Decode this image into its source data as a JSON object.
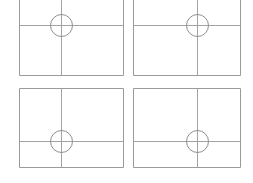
{
  "canvas": {
    "width": 253,
    "height": 183,
    "background_color": "#ffffff"
  },
  "style": {
    "frame_stroke_color": "#9a9a9a",
    "crosshair_stroke_color": "#a3a3a3",
    "circle_stroke_color": "#8f8f8f",
    "frame_stroke_width": 1,
    "crosshair_stroke_width": 1,
    "circle_stroke_width": 1
  },
  "layout": {
    "rows": 2,
    "columns": 2,
    "panel_count": 4
  },
  "panels": [
    {
      "id": "panel-top-left",
      "name": "Top Left Panel",
      "x": 19,
      "y": -7,
      "width": 104,
      "height": 82,
      "crosshair_x": 61,
      "crosshair_y": 25,
      "circle_cx": 61,
      "circle_cy": 25,
      "circle_r": 11
    },
    {
      "id": "panel-top-right",
      "name": "Top Right Panel",
      "x": 133,
      "y": -7,
      "width": 107,
      "height": 82,
      "crosshair_x": 197,
      "crosshair_y": 25,
      "circle_cx": 197,
      "circle_cy": 25,
      "circle_r": 11
    },
    {
      "id": "panel-bottom-left",
      "name": "Bottom Left Panel",
      "x": 19,
      "y": 88,
      "width": 104,
      "height": 79,
      "crosshair_x": 61,
      "crosshair_y": 141,
      "circle_cx": 61,
      "circle_cy": 141,
      "circle_r": 11
    },
    {
      "id": "panel-bottom-right",
      "name": "Bottom Right Panel",
      "x": 133,
      "y": 88,
      "width": 107,
      "height": 79,
      "crosshair_x": 197,
      "crosshair_y": 141,
      "circle_cx": 197,
      "circle_cy": 141,
      "circle_r": 11
    }
  ]
}
